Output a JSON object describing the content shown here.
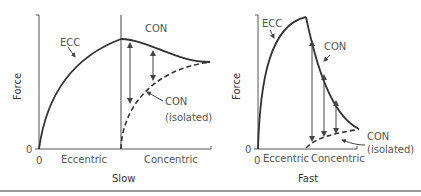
{
  "panels": [
    {
      "title": "Slow",
      "ylabel": "Force",
      "y_zero": "0",
      "x_zero": "0",
      "x_left_label": "Eccentric",
      "x_right_label": "Concentric",
      "annotations": {
        "ecc": "ECC",
        "con": "CON",
        "con_isolated_1": "CON",
        "con_isolated_2": "(isolated)"
      }
    },
    {
      "title": "Fast",
      "ylabel": "Force",
      "y_zero": "0",
      "x_zero": "0",
      "x_left_label": "Eccentric",
      "x_right_label": "Concentric",
      "annotations": {
        "ecc": "ECC",
        "con": "CON",
        "con_isolated_1": "CON",
        "con_isolated_2": "(isolated)"
      }
    }
  ],
  "colors": {
    "line": "#333333",
    "axis": "#555555",
    "arrow": "#444444"
  }
}
